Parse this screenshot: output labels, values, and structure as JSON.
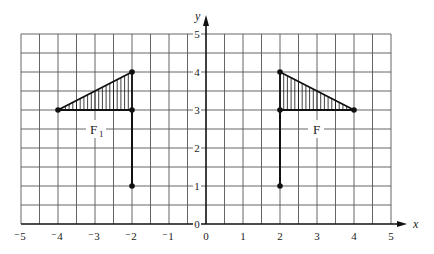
{
  "diagram": {
    "type": "coordinate-grid-reflection",
    "x_axis": {
      "name": "x",
      "range": [
        -5,
        5
      ],
      "ticks": [
        -5,
        -4,
        -3,
        -2,
        -1,
        0,
        1,
        2,
        3,
        4,
        5
      ],
      "tick_labels": [
        "⁻5",
        "⁻4",
        "⁻3",
        "⁻2",
        "⁻1",
        "0",
        "1",
        "2",
        "3",
        "4",
        "5"
      ]
    },
    "y_axis": {
      "name": "y",
      "range": [
        0,
        5
      ],
      "ticks": [
        0,
        1,
        2,
        3,
        4,
        5
      ],
      "tick_labels": [
        "0",
        "1",
        "2",
        "3",
        "4",
        "5"
      ]
    },
    "grid_step": 0.5,
    "shapes": [
      {
        "name": "F1",
        "label": "F",
        "subscript": "1",
        "label_pos": [
          -3,
          2.5
        ],
        "triangle": [
          [
            -4,
            3
          ],
          [
            -2,
            4
          ],
          [
            -2,
            3
          ]
        ],
        "stem": [
          [
            -2,
            3
          ],
          [
            -2,
            1
          ]
        ],
        "points": [
          [
            -4,
            3
          ],
          [
            -2,
            4
          ],
          [
            -2,
            3
          ],
          [
            -2,
            1
          ]
        ],
        "hatched": true
      },
      {
        "name": "F",
        "label": "F",
        "subscript": "",
        "label_pos": [
          3,
          2.5
        ],
        "triangle": [
          [
            4,
            3
          ],
          [
            2,
            4
          ],
          [
            2,
            3
          ]
        ],
        "stem": [
          [
            2,
            3
          ],
          [
            2,
            1
          ]
        ],
        "points": [
          [
            4,
            3
          ],
          [
            2,
            4
          ],
          [
            2,
            3
          ],
          [
            2,
            1
          ]
        ],
        "hatched": true
      }
    ],
    "colors": {
      "grid": "#555555",
      "ink": "#111111",
      "background": "#ffffff"
    }
  }
}
